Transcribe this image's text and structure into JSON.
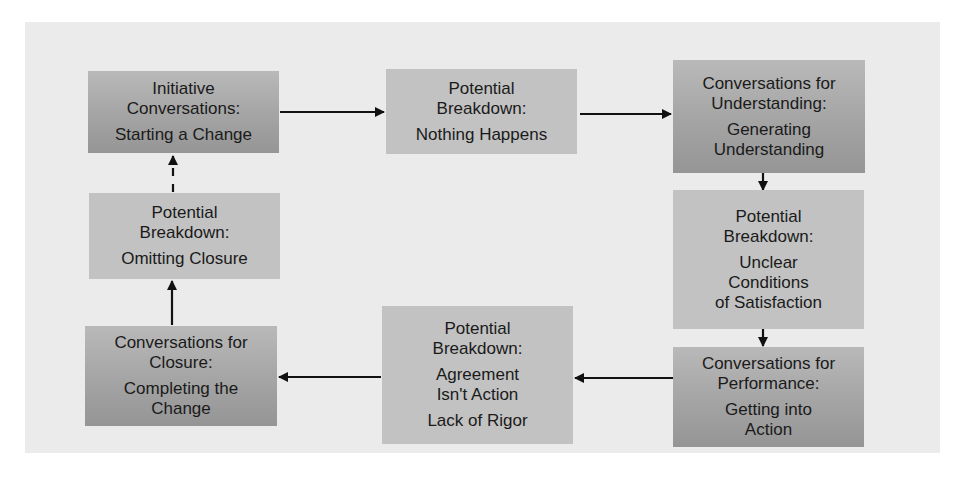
{
  "diagram": {
    "nodes": [
      {
        "id": "initiative",
        "type": "conversation",
        "title": "Initiative Conversations:",
        "subs": [
          "Starting a Change"
        ]
      },
      {
        "id": "breakdown-nothing",
        "type": "breakdown",
        "title": "Potential Breakdown:",
        "subs": [
          "Nothing Happens"
        ]
      },
      {
        "id": "understanding",
        "type": "conversation",
        "title": "Conversations for Understanding:",
        "subs": [
          "Generating Understanding"
        ]
      },
      {
        "id": "breakdown-unclear",
        "type": "breakdown",
        "title": "Potential Breakdown:",
        "subs": [
          "Unclear Conditions of Satisfaction"
        ]
      },
      {
        "id": "performance",
        "type": "conversation",
        "title": "Conversations for Performance:",
        "subs": [
          "Getting into Action"
        ]
      },
      {
        "id": "breakdown-agreement",
        "type": "breakdown",
        "title": "Potential Breakdown:",
        "subs": [
          "Agreement Isn't Action",
          "Lack of Rigor"
        ]
      },
      {
        "id": "closure",
        "type": "conversation",
        "title": "Conversations for Closure:",
        "subs": [
          "Completing the Change"
        ]
      },
      {
        "id": "breakdown-omitting",
        "type": "breakdown",
        "title": "Potential Breakdown:",
        "subs": [
          "Omitting Closure"
        ]
      }
    ],
    "edges": [
      {
        "from": "initiative",
        "to": "breakdown-nothing",
        "style": "solid"
      },
      {
        "from": "breakdown-nothing",
        "to": "understanding",
        "style": "solid"
      },
      {
        "from": "understanding",
        "to": "breakdown-unclear",
        "style": "solid"
      },
      {
        "from": "breakdown-unclear",
        "to": "performance",
        "style": "solid"
      },
      {
        "from": "performance",
        "to": "breakdown-agreement",
        "style": "solid"
      },
      {
        "from": "breakdown-agreement",
        "to": "closure",
        "style": "solid"
      },
      {
        "from": "closure",
        "to": "breakdown-omitting",
        "style": "solid"
      },
      {
        "from": "breakdown-omitting",
        "to": "initiative",
        "style": "dashed"
      }
    ]
  },
  "labels": {
    "n1": {
      "title1": "Initiative",
      "title2": "Conversations:",
      "sub1": "Starting a Change"
    },
    "n2": {
      "title1": "Potential",
      "title2": "Breakdown:",
      "sub1": "Nothing Happens"
    },
    "n3": {
      "title1": "Conversations for",
      "title2": "Understanding:",
      "sub1": "Generating",
      "sub2": "Understanding"
    },
    "n4": {
      "title1": "Potential",
      "title2": "Breakdown:",
      "sub1": "Unclear",
      "sub2": "Conditions",
      "sub3": "of Satisfaction"
    },
    "n5": {
      "title1": "Conversations for",
      "title2": "Performance:",
      "sub1": "Getting into",
      "sub2": "Action"
    },
    "n6": {
      "title1": "Potential",
      "title2": "Breakdown:",
      "sub1": "Agreement",
      "sub2": "Isn't Action",
      "sub3": "Lack of Rigor"
    },
    "n7": {
      "title1": "Conversations for",
      "title2": "Closure:",
      "sub1": "Completing the",
      "sub2": "Change"
    },
    "n8": {
      "title1": "Potential",
      "title2": "Breakdown:",
      "sub1": "Omitting Closure"
    }
  },
  "colors": {
    "background": "#ebebeb",
    "conversation_box": "#a4a4a4",
    "breakdown_box": "#c2c2c2",
    "arrow": "#111111",
    "text": "#1a1a1a"
  }
}
